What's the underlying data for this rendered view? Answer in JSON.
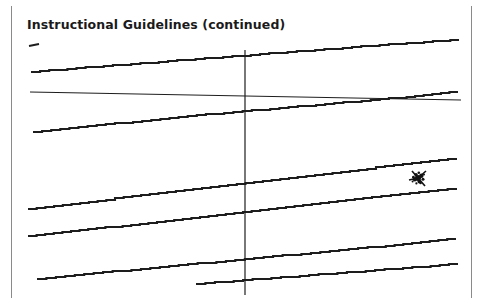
{
  "page": {
    "width": 489,
    "height": 303,
    "background_color": "#ffffff",
    "frame_color": "#8a8a8a",
    "ink_color": "#1d1d1d"
  },
  "heading": {
    "text": "Instructional Guidelines (continued)",
    "color": "#1a1a1a",
    "bold": true
  },
  "chart_data": {
    "type": "line",
    "title": "Instructional Guidelines (continued)",
    "subtitle": "",
    "xlabel": "",
    "ylabel": "",
    "grid": false,
    "legend": null,
    "legend_position": "none",
    "axis_style": "crosshair",
    "xlim": [
      0,
      489
    ],
    "ylim": [
      303,
      0
    ],
    "note": "Scanned/faxed line diagram: a vertical axis line crossed by one near-horizontal line and seven nearly-parallel upward-sloping traces rendered with pixelated stair-stepping.",
    "axes": [
      {
        "name": "vertical-axis",
        "orientation": "vertical",
        "x": 245,
        "y_start": 50,
        "y_end": 295,
        "stroke_width": 1.2
      },
      {
        "name": "horizontal-axis",
        "orientation": "horizontal",
        "x_start": 30,
        "x_end": 461,
        "y_start": 92,
        "y_end": 100,
        "stroke_width": 1.2
      }
    ],
    "series": [
      {
        "name": "trace-1",
        "label": "",
        "stub": true,
        "x": [
          29,
          39
        ],
        "values": [
          46,
          44
        ],
        "stroke_width": 2.1
      },
      {
        "name": "trace-2",
        "label": "",
        "stub": false,
        "x": [
          31,
          122,
          214,
          306,
          398,
          459
        ],
        "values": [
          72,
          65,
          58,
          51,
          44,
          40
        ],
        "stroke_width": 2.1
      },
      {
        "name": "trace-3",
        "label": "",
        "stub": false,
        "x": [
          33,
          124,
          215,
          307,
          398,
          458
        ],
        "values": [
          132,
          123,
          114,
          106,
          98,
          92
        ],
        "stroke_width": 2.1
      },
      {
        "name": "trace-4",
        "label": "",
        "stub": false,
        "x": [
          28,
          115,
          202,
          289,
          376,
          457
        ],
        "values": [
          209,
          199,
          188,
          178,
          168,
          158
        ],
        "stroke_width": 2.1
      },
      {
        "name": "trace-5",
        "label": "",
        "stub": false,
        "x": [
          28,
          114,
          200,
          286,
          372,
          457
        ],
        "values": [
          236,
          227,
          217,
          207,
          198,
          188
        ],
        "stroke_width": 2.1
      },
      {
        "name": "trace-6",
        "label": "",
        "stub": false,
        "x": [
          37,
          122,
          207,
          292,
          377,
          456
        ],
        "values": [
          279,
          271,
          263,
          255,
          247,
          239
        ],
        "stroke_width": 2.1
      },
      {
        "name": "trace-7",
        "label": "",
        "stub": false,
        "x": [
          196,
          262,
          328,
          394,
          458
        ],
        "values": [
          284,
          279,
          274,
          269,
          264
        ],
        "stroke_width": 2.1
      }
    ],
    "annotations": [
      {
        "name": "ink-blot",
        "type": "scribble",
        "x": 418,
        "y": 178,
        "radius": 9,
        "color": "#121212"
      }
    ]
  }
}
